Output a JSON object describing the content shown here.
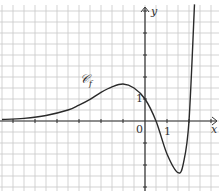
{
  "chart_data": {
    "type": "line",
    "title": "",
    "xlabel": "x",
    "ylabel": "y",
    "curve_label": "𝒞f",
    "origin_label": "0",
    "x_tick_label": "1",
    "y_tick_label": "1",
    "grid": true,
    "grid_step": 0.5,
    "xlim": [
      -6.6,
      3.3
    ],
    "ylim": [
      -3.0,
      5.3
    ],
    "series": [
      {
        "name": "𝒞f",
        "x": [
          -6.5,
          -5.5,
          -4.5,
          -3.5,
          -3,
          -2.5,
          -2,
          -1.5,
          -1,
          -0.5,
          0,
          0.5,
          1,
          1.5,
          1.75,
          2,
          2.25
        ],
        "y": [
          0.07,
          0.12,
          0.25,
          0.5,
          0.72,
          0.98,
          1.3,
          1.55,
          1.68,
          1.5,
          1.0,
          0.0,
          -1.5,
          -2.35,
          -1.9,
          0.0,
          5.3
        ]
      }
    ],
    "key_points": {
      "local_max": [
        -1,
        1.7
      ],
      "y_intercept": [
        0,
        1
      ],
      "x_intercepts": [
        0.5,
        2.0
      ],
      "local_min": [
        1.5,
        -2.3
      ]
    }
  },
  "labels": {
    "curve": "𝒞",
    "curve_sub": "f",
    "x_axis": "x",
    "y_axis": "y",
    "origin": "0",
    "x_one": "1",
    "y_one": "1"
  },
  "colors": {
    "grid": "#c8c8c8",
    "axis": "#333333",
    "curve": "#2a2a2a"
  }
}
